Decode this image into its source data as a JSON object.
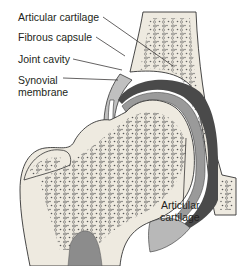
{
  "diagram": {
    "labels": [
      {
        "id": "articular-cartilage-top",
        "text": "Articular cartilage"
      },
      {
        "id": "fibrous-capsule",
        "text": "Fibrous capsule"
      },
      {
        "id": "joint-cavity",
        "text": "Joint cavity"
      },
      {
        "id": "synovial-membrane-1",
        "text": "Synovial"
      },
      {
        "id": "synovial-membrane-2",
        "text": "membrane"
      },
      {
        "id": "articular-cartilage-bottom-1",
        "text": "Articular"
      },
      {
        "id": "articular-cartilage-bottom-2",
        "text": "cartilage"
      }
    ],
    "colors": {
      "bone": "#eeeae0",
      "spongy_dots": "#5a5a5a",
      "cartilage": "#9a9a9a",
      "capsule": "#b8b8b8",
      "cavity": "#4a4a4a",
      "marrow": "#8c8c8c",
      "outline": "#333333"
    }
  }
}
